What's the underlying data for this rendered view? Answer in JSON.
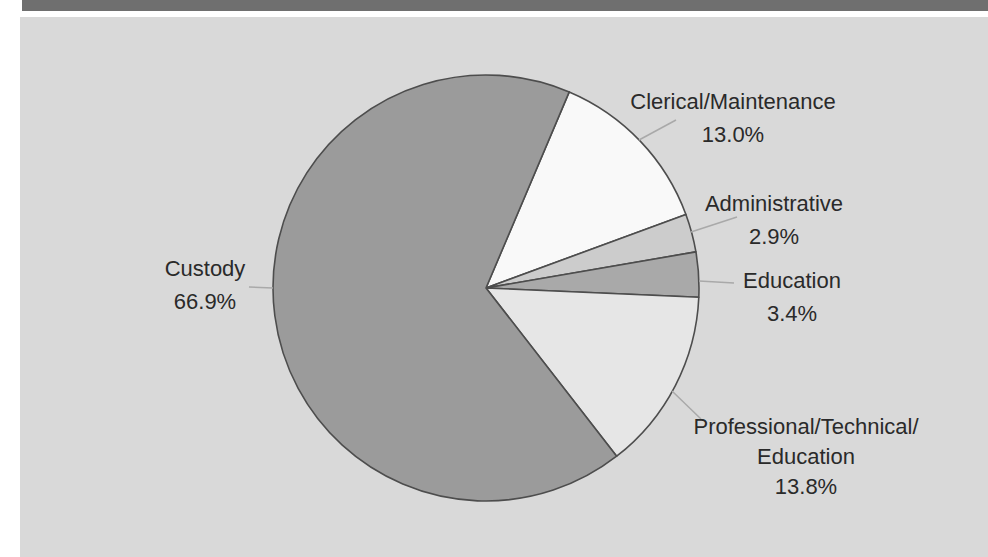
{
  "page": {
    "background": "#ffffff",
    "header_bar_color": "#6f6f6f",
    "panel_color": "#d9d9d9",
    "text_color": "#2a2a2a"
  },
  "chart_data": {
    "type": "pie",
    "title": "",
    "unit": "percent",
    "total": 100.0,
    "start_angle_deg": 23,
    "direction": "clockwise",
    "legend": "none",
    "labels_position": "outside-with-leader-lines",
    "stroke_color": "#4d4d4d",
    "leader_color": "#a9a9a9",
    "segments": [
      {
        "lines": [
          "Clerical/Maintenance"
        ],
        "pct_label": "13.0%",
        "value": 13.0,
        "color": "#f9f9f9"
      },
      {
        "lines": [
          "Administrative"
        ],
        "pct_label": "2.9%",
        "value": 2.9,
        "color": "#cccccc"
      },
      {
        "lines": [
          "Education"
        ],
        "pct_label": "3.4%",
        "value": 3.4,
        "color": "#a9a9a9"
      },
      {
        "lines": [
          "Professional/Technical/",
          "Education"
        ],
        "pct_label": "13.8%",
        "value": 13.8,
        "color": "#e6e6e6"
      },
      {
        "lines": [
          "Custody"
        ],
        "pct_label": "66.9%",
        "value": 66.9,
        "color": "#9b9b9b"
      }
    ]
  }
}
